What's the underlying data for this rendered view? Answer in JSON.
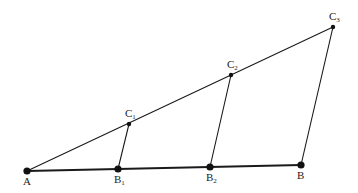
{
  "diagram": {
    "type": "geometric-construction",
    "points": {
      "A": {
        "name": "A",
        "sub": ""
      },
      "B1": {
        "name": "B",
        "sub": "1"
      },
      "B2": {
        "name": "B",
        "sub": "2"
      },
      "B": {
        "name": "B",
        "sub": ""
      },
      "C1": {
        "name": "C",
        "sub": "1"
      },
      "C2": {
        "name": "C",
        "sub": "2"
      },
      "C3": {
        "name": "C",
        "sub": "3"
      }
    },
    "segments": [
      {
        "from": "A",
        "to": "B",
        "style": "base"
      },
      {
        "from": "A",
        "to": "C3",
        "style": "thin"
      },
      {
        "from": "C1",
        "to": "B1",
        "style": "thin"
      },
      {
        "from": "C2",
        "to": "B2",
        "style": "thin"
      },
      {
        "from": "C3",
        "to": "B",
        "style": "thin"
      }
    ]
  }
}
